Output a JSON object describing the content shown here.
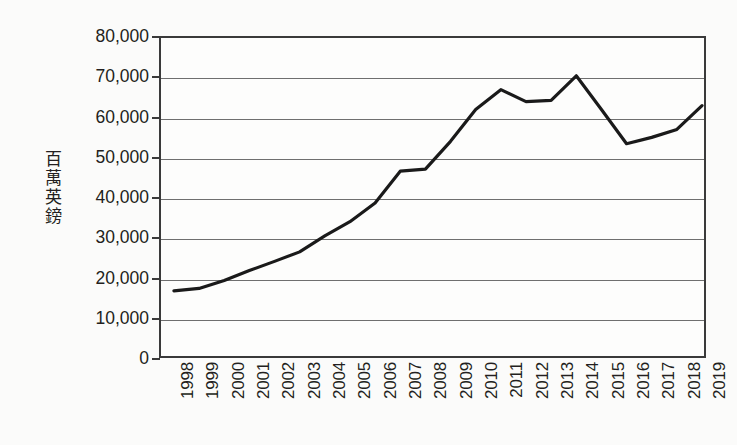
{
  "chart_data": {
    "type": "line",
    "title": "",
    "subtitle": "",
    "xlabel": "",
    "ylabel": "百萬英鎊",
    "categories": [
      "1998",
      "1999",
      "2000",
      "2001",
      "2002",
      "2003",
      "2004",
      "2005",
      "2006",
      "2007",
      "2008",
      "2009",
      "2010",
      "2011",
      "2012",
      "2013",
      "2014",
      "2015",
      "2016",
      "2017",
      "2018",
      "2019"
    ],
    "values": [
      16400,
      17000,
      19000,
      21500,
      23800,
      26200,
      30200,
      33800,
      38500,
      46500,
      47000,
      54000,
      62000,
      67000,
      64000,
      64300,
      70500,
      62000,
      53400,
      55000,
      57000,
      63000
    ],
    "series": [
      {
        "name": "百萬英鎊",
        "values": [
          16400,
          17000,
          19000,
          21500,
          23800,
          26200,
          30200,
          33800,
          38500,
          46500,
          47000,
          54000,
          62000,
          67000,
          64000,
          64300,
          70500,
          62000,
          53400,
          55000,
          57000,
          63000
        ]
      }
    ],
    "ylim": [
      0,
      80000
    ],
    "y_ticks": [
      0,
      10000,
      20000,
      30000,
      40000,
      50000,
      60000,
      70000,
      80000
    ],
    "y_tick_labels": [
      "0",
      "10,000",
      "20,000",
      "30,000",
      "40,000",
      "50,000",
      "60,000",
      "70,000",
      "80,000"
    ],
    "grid": true,
    "legend": "none",
    "line_color": "#1a1a1a",
    "grid_color": "#6f6f6f",
    "axis_color": "#3a3a3a",
    "background_color": "#fbfbfa",
    "annotations": []
  }
}
